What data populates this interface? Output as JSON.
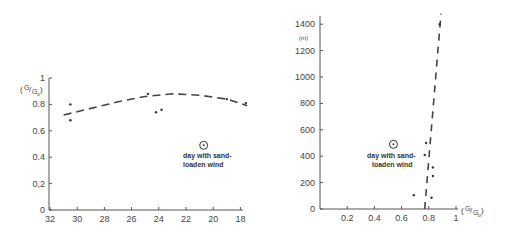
{
  "chart_data": [
    {
      "type": "scatter",
      "title": "",
      "xlabel": "",
      "ylabel": "(G/Go)",
      "xlim": [
        32,
        17.5
      ],
      "ylim": [
        0,
        1
      ],
      "x_ticks": [
        "32",
        "30",
        "28",
        "26",
        "24",
        "22",
        "20",
        "18"
      ],
      "y_ticks": [
        "0",
        "0,2",
        "0.4",
        "0.6",
        "0.8",
        "1"
      ],
      "grid": false,
      "series": [
        {
          "name": "observations",
          "x": [
            30.5,
            30.5,
            24.8,
            24.2,
            23.8,
            19.0,
            17.6
          ],
          "y": [
            0.8,
            0.68,
            0.88,
            0.74,
            0.76,
            0.84,
            0.81
          ]
        },
        {
          "name": "day with sand-loaden wind",
          "x": [
            20.7
          ],
          "y": [
            0.49
          ],
          "marker": "circled-dot"
        },
        {
          "name": "trend (dashed)",
          "x": [
            31,
            29,
            27,
            25,
            23,
            21,
            19,
            17.5
          ],
          "y": [
            0.72,
            0.77,
            0.82,
            0.86,
            0.88,
            0.87,
            0.84,
            0.79
          ],
          "style": "dashed"
        }
      ],
      "annotations": [
        {
          "text": "day with sand-\nloaden wind",
          "x": 20.7,
          "y": 0.42
        }
      ]
    },
    {
      "type": "scatter",
      "title": "",
      "xlabel": "(G/Go)",
      "ylabel": "(m)",
      "xlim": [
        0,
        1
      ],
      "ylim": [
        0,
        1480
      ],
      "x_ticks": [
        "0.2",
        "0.4",
        "0.6",
        "0.8",
        "1"
      ],
      "y_ticks": [
        "0",
        "200",
        "400",
        "600",
        "800",
        "1000",
        "1200",
        "1400"
      ],
      "grid": false,
      "series": [
        {
          "name": "observations",
          "x": [
            0.69,
            0.78,
            0.77,
            0.83,
            0.83,
            0.82,
            0.88
          ],
          "y": [
            105,
            500,
            410,
            315,
            250,
            85,
            1400
          ]
        },
        {
          "name": "day with sand-loaden wind",
          "x": [
            0.54
          ],
          "y": [
            490
          ],
          "marker": "circled-dot"
        },
        {
          "name": "trend (dashed)",
          "x": [
            0.77,
            0.89
          ],
          "y": [
            0,
            1480
          ],
          "style": "dashed"
        }
      ],
      "annotations": [
        {
          "text": "day with sand-\nloaden wind",
          "x": 0.45,
          "y": 400
        }
      ]
    }
  ],
  "left": {
    "ylabel": "(G/Go)",
    "y_ticks": [
      "0",
      "0,2",
      "0.4",
      "0.6",
      "0.8",
      "1"
    ],
    "x_ticks": [
      "32",
      "30",
      "28",
      "26",
      "24",
      "22",
      "20",
      "18"
    ],
    "annot_line1": "day with sand-",
    "annot_line2": "loaden wind"
  },
  "right": {
    "yunit": "(m)",
    "xlabel": "(G/Go)",
    "y_ticks": [
      "0",
      "200",
      "400",
      "600",
      "800",
      "1000",
      "1200",
      "1400"
    ],
    "x_ticks": [
      "0.2",
      "0.4",
      "0.6",
      "0.8",
      "1"
    ],
    "annot_line1": "day with sand-",
    "annot_line2": "loaden wind"
  }
}
